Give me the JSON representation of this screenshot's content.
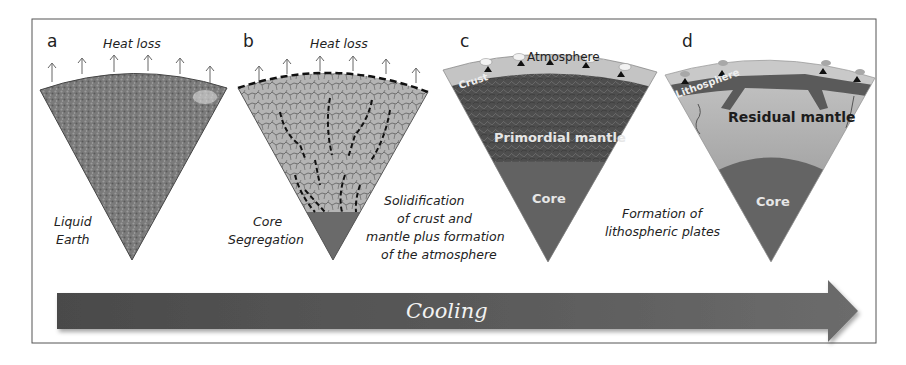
{
  "figure": {
    "colors": {
      "frame": "#555555",
      "liquid_earth": "#7a7a7a",
      "segregation_fill": "#b4b4b4",
      "crack_lines": "#5e5e5e",
      "core": "#6a6a6a",
      "atmosphere": "#c4c4c4",
      "primordial_mantle": "#4e4e4e",
      "residual_mantle_top": "#b9b9b9",
      "residual_mantle_bottom": "#8f8f8f",
      "lithosphere": "#5c5c5c",
      "arrow": "#5a5a5a"
    },
    "panels": [
      {
        "letter": "a",
        "top_label": "Heat loss",
        "caption": [
          "Liquid",
          "Earth"
        ]
      },
      {
        "letter": "b",
        "top_label": "Heat loss",
        "caption": [
          "Core",
          "Segregation"
        ]
      },
      {
        "letter": "c",
        "top_label": "Atmosphere",
        "layer_labels": {
          "crust": "Crust",
          "mantle": "Primordial mantle",
          "core": "Core"
        },
        "caption": [
          "Solidification",
          "of crust and",
          "mantle plus formation",
          "of the atmosphere"
        ]
      },
      {
        "letter": "d",
        "layer_labels": {
          "lithosphere": "Lithosphere",
          "mantle": "Residual mantle",
          "core": "Core"
        },
        "caption": [
          "Formation of",
          "lithospheric plates"
        ]
      }
    ],
    "arrow_label": "Cooling"
  }
}
